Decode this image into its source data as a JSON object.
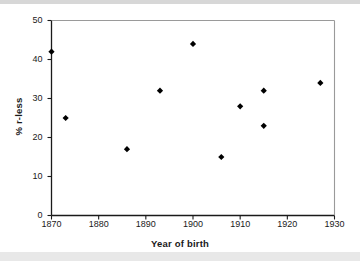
{
  "chart_data": {
    "type": "scatter",
    "title": "",
    "xlabel": "Year of birth",
    "ylabel": "% r-less",
    "xlim": [
      1870,
      1930
    ],
    "ylim": [
      0,
      50
    ],
    "xticks": [
      1870,
      1880,
      1890,
      1900,
      1910,
      1920,
      1930
    ],
    "yticks": [
      0,
      10,
      20,
      30,
      40,
      50
    ],
    "grid": false,
    "legend": null,
    "marker": "diamond",
    "marker_color": "#000000",
    "series": [
      {
        "name": "% r-less by year of birth",
        "points": [
          {
            "x": 1870,
            "y": 42
          },
          {
            "x": 1873,
            "y": 25
          },
          {
            "x": 1886,
            "y": 17
          },
          {
            "x": 1893,
            "y": 32
          },
          {
            "x": 1900,
            "y": 44
          },
          {
            "x": 1906,
            "y": 15
          },
          {
            "x": 1910,
            "y": 28
          },
          {
            "x": 1915,
            "y": 32
          },
          {
            "x": 1915,
            "y": 23
          },
          {
            "x": 1927,
            "y": 34
          }
        ]
      }
    ]
  },
  "axes": {
    "x_title": "Year of birth",
    "y_title": "% r-less",
    "x_tick_labels": [
      "1870",
      "1880",
      "1890",
      "1900",
      "1910",
      "1920",
      "1930"
    ],
    "y_tick_labels": [
      "0",
      "10",
      "20",
      "30",
      "40",
      "50"
    ]
  },
  "colors": {
    "marker": "#000000",
    "axis": "#1a1a1a",
    "spine_light": "#9a9a9a",
    "background": "#ffffff"
  }
}
